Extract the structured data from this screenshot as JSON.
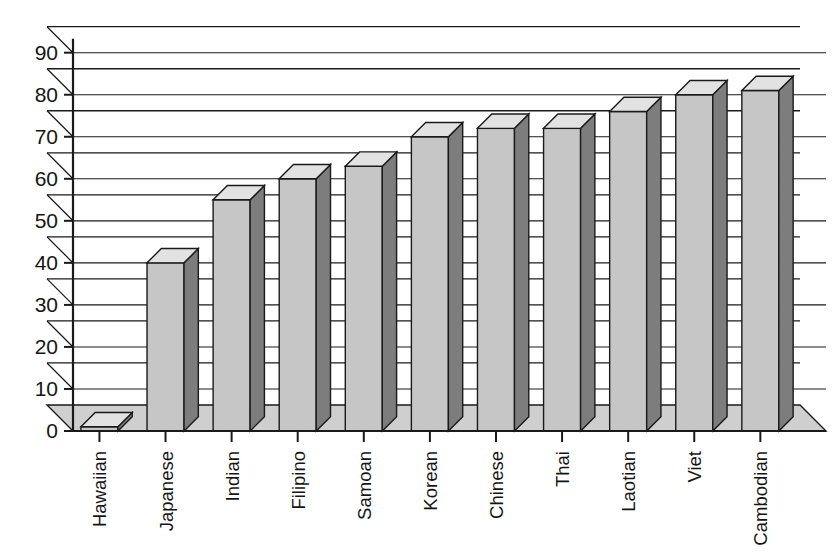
{
  "chart_data": {
    "type": "bar",
    "style": "3d-column",
    "title": "",
    "subtitle": "",
    "xlabel": "",
    "ylabel": "",
    "categories": [
      "Hawaiian",
      "Japanese",
      "Indian",
      "Filipino",
      "Samoan",
      "Korean",
      "Chinese",
      "Thai",
      "Laotian",
      "Viet",
      "Cambodian"
    ],
    "values": [
      1,
      40,
      55,
      60,
      63,
      70,
      72,
      72,
      76,
      80,
      81
    ],
    "ylim": [
      0,
      90
    ],
    "ytick_labels": [
      "0",
      "10",
      "20",
      "30",
      "40",
      "50",
      "60",
      "70",
      "80",
      "90"
    ],
    "ytick_values": [
      0,
      10,
      20,
      30,
      40,
      50,
      60,
      70,
      80,
      90
    ],
    "grid": true,
    "grid_axis": "y",
    "legend": null,
    "legend_position": "none",
    "annotations": [],
    "colors": {
      "bar_front": "#c6c6c6",
      "bar_side": "#7d7d7d",
      "bar_top": "#e2e2e2",
      "floor": "#cfcfcf",
      "outline": "#1a1a1a",
      "axis": "#1a1a1a",
      "background": "#ffffff"
    }
  },
  "axis": {
    "y_ticks": [
      {
        "label": "90",
        "value": 90
      },
      {
        "label": "80",
        "value": 80
      },
      {
        "label": "70",
        "value": 70
      },
      {
        "label": "60",
        "value": 60
      },
      {
        "label": "50",
        "value": 50
      },
      {
        "label": "40",
        "value": 40
      },
      {
        "label": "30",
        "value": 30
      },
      {
        "label": "20",
        "value": 20
      },
      {
        "label": "10",
        "value": 10
      },
      {
        "label": "0",
        "value": 0
      }
    ]
  },
  "categories": [
    {
      "label": "Hawaiian",
      "value": 1
    },
    {
      "label": "Japanese",
      "value": 40
    },
    {
      "label": "Indian",
      "value": 55
    },
    {
      "label": "Filipino",
      "value": 60
    },
    {
      "label": "Samoan",
      "value": 63
    },
    {
      "label": "Korean",
      "value": 70
    },
    {
      "label": "Chinese",
      "value": 72
    },
    {
      "label": "Thai",
      "value": 72
    },
    {
      "label": "Laotian",
      "value": 76
    },
    {
      "label": "Viet",
      "value": 80
    },
    {
      "label": "Cambodian",
      "value": 81
    }
  ]
}
